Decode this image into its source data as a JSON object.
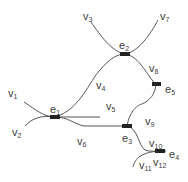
{
  "diagram": {
    "type": "hypergraph",
    "colors": {
      "edge_stroke": "#555555",
      "node_fill": "#222222",
      "text": "#3a3a3a"
    },
    "hyperedges": [
      {
        "id": "e1",
        "base": "e",
        "sub": "1"
      },
      {
        "id": "e2",
        "base": "e",
        "sub": "2"
      },
      {
        "id": "e3",
        "base": "e",
        "sub": "3"
      },
      {
        "id": "e4",
        "base": "e",
        "sub": "4"
      },
      {
        "id": "e5",
        "base": "e",
        "sub": "5"
      }
    ],
    "vertices": [
      {
        "id": "v1",
        "base": "v",
        "sub": "1"
      },
      {
        "id": "v2",
        "base": "v",
        "sub": "2"
      },
      {
        "id": "v3",
        "base": "v",
        "sub": "3"
      },
      {
        "id": "v4",
        "base": "v",
        "sub": "4"
      },
      {
        "id": "v5",
        "base": "v",
        "sub": "5"
      },
      {
        "id": "v6",
        "base": "v",
        "sub": "6"
      },
      {
        "id": "v7",
        "base": "v",
        "sub": "7"
      },
      {
        "id": "v8",
        "base": "v",
        "sub": "8"
      },
      {
        "id": "v9",
        "base": "v",
        "sub": "9"
      },
      {
        "id": "v10",
        "base": "v",
        "sub": "10"
      },
      {
        "id": "v11",
        "base": "v",
        "sub": "11"
      },
      {
        "id": "v12",
        "base": "v",
        "sub": "12"
      }
    ],
    "connections": [
      {
        "from": "v1",
        "to": "e1"
      },
      {
        "from": "v2",
        "to": "e1"
      },
      {
        "from": "e1",
        "to": "e2",
        "via": "v4"
      },
      {
        "from": "e1",
        "to": "v5"
      },
      {
        "from": "e1",
        "to": "e3",
        "via": "v6"
      },
      {
        "from": "v3",
        "to": "e2"
      },
      {
        "from": "v7",
        "to": "e2"
      },
      {
        "from": "e2",
        "to": "e5",
        "via": "v8"
      },
      {
        "from": "e3",
        "to": "e5",
        "via": "v9"
      },
      {
        "from": "e3",
        "to": "e4",
        "via": "v10"
      },
      {
        "from": "v11",
        "to": "e4"
      },
      {
        "from": "v12",
        "to": "e4"
      }
    ]
  }
}
